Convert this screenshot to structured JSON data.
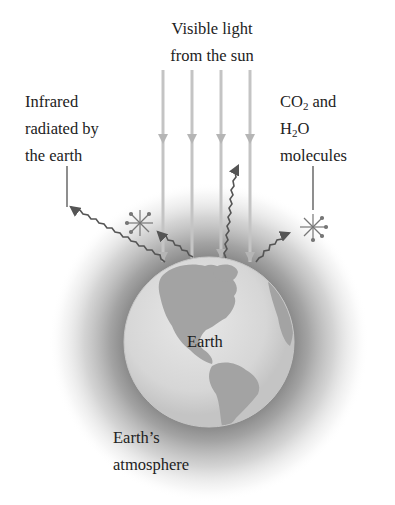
{
  "diagram": {
    "labels": {
      "sunlight": [
        "Visible light",
        "from the sun"
      ],
      "infrared": [
        "Infrared",
        "radiated by",
        "the earth"
      ],
      "molecules": {
        "line1_prefix": "CO",
        "line1_sub": "2",
        "line1_suffix": " and",
        "line2_prefix": "H",
        "line2_sub": "2",
        "line2_suffix": "O",
        "line3": "molecules"
      },
      "earth": "Earth",
      "atmosphere": [
        "Earth’s",
        "atmosphere"
      ]
    },
    "elements": {
      "sunlight_rays": 4,
      "infrared_wavy_arrows": 4,
      "molecule_starbursts": 2
    },
    "colors": {
      "background": "#ffffff",
      "ray": "#bdbdbd",
      "wave": "#555555",
      "earth_ocean": "#d9d9d9",
      "earth_land": "#9a9a9a",
      "atmosphere": "#8a8a8a",
      "text": "#222222"
    }
  }
}
